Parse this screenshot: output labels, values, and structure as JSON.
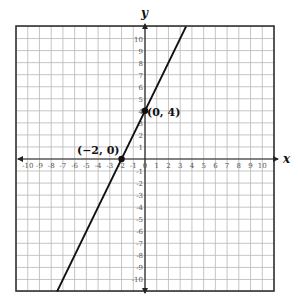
{
  "chart_data": {
    "type": "line",
    "title": "",
    "xlabel": "x",
    "ylabel": "y",
    "xlim": [
      -11,
      11
    ],
    "ylim": [
      -11,
      11
    ],
    "grid": true,
    "x_ticks": [
      -10,
      -9,
      -8,
      -7,
      -6,
      -5,
      -4,
      -3,
      -2,
      -1,
      0,
      1,
      2,
      3,
      4,
      5,
      6,
      7,
      8,
      9,
      10
    ],
    "y_ticks": [
      -10,
      -9,
      -8,
      -7,
      -6,
      -5,
      -4,
      -3,
      -2,
      -1,
      1,
      2,
      3,
      4,
      5,
      6,
      7,
      8,
      9,
      10
    ],
    "series": [
      {
        "name": "line",
        "equation": "y = 2x + 4",
        "slope": 2,
        "intercept": 4,
        "x": [
          -7.5,
          3.5
        ],
        "y": [
          -11,
          11
        ]
      }
    ],
    "points": [
      {
        "label": "(−2, 0)",
        "x": -2,
        "y": 0
      },
      {
        "label": "(0, 4)",
        "x": 0,
        "y": 4
      }
    ]
  },
  "labels": {
    "x_axis": "x",
    "y_axis": "y"
  }
}
